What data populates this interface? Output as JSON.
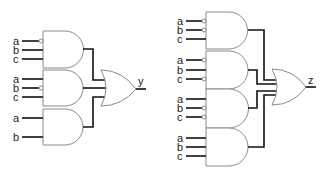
{
  "circuits": [
    {
      "output_label": "y",
      "and_gates": [
        {
          "inputs": [
            {
              "label": "a",
              "inverted": true
            },
            {
              "label": "b",
              "inverted": false
            },
            {
              "label": "c",
              "inverted": false
            }
          ]
        },
        {
          "inputs": [
            {
              "label": "a",
              "inverted": false
            },
            {
              "label": "b",
              "inverted": true
            },
            {
              "label": "c",
              "inverted": false
            }
          ]
        },
        {
          "inputs": [
            {
              "label": "a",
              "inverted": false
            },
            {
              "label": "b",
              "inverted": false
            }
          ]
        }
      ],
      "or_gate": "OR"
    },
    {
      "output_label": "z",
      "and_gates": [
        {
          "inputs": [
            {
              "label": "a",
              "inverted": true
            },
            {
              "label": "b",
              "inverted": true
            },
            {
              "label": "c",
              "inverted": false
            }
          ]
        },
        {
          "inputs": [
            {
              "label": "a",
              "inverted": true
            },
            {
              "label": "b",
              "inverted": false
            },
            {
              "label": "c",
              "inverted": true
            }
          ]
        },
        {
          "inputs": [
            {
              "label": "a",
              "inverted": false
            },
            {
              "label": "b",
              "inverted": true
            },
            {
              "label": "c",
              "inverted": true
            }
          ]
        },
        {
          "inputs": [
            {
              "label": "a",
              "inverted": false
            },
            {
              "label": "b",
              "inverted": false
            },
            {
              "label": "c",
              "inverted": false
            }
          ]
        }
      ],
      "or_gate": "OR"
    }
  ]
}
